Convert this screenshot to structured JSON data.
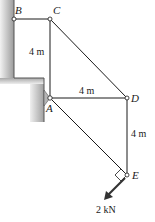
{
  "diagram": {
    "type": "truss",
    "nodes": {
      "B": {
        "label": "B",
        "x": 14,
        "y": 19
      },
      "C": {
        "label": "C",
        "x": 50,
        "y": 19
      },
      "A": {
        "label": "A",
        "x": 50,
        "y": 98
      },
      "D": {
        "label": "D",
        "x": 127,
        "y": 98
      },
      "E": {
        "label": "E",
        "x": 127,
        "y": 175
      }
    },
    "members": [
      "B-C",
      "C-A",
      "C-D",
      "A-D",
      "A-E",
      "D-E"
    ],
    "dimensions": {
      "CA": "4 m",
      "AD": "4 m",
      "DE": "4 m"
    },
    "load": {
      "label": "2 kN",
      "node": "E"
    },
    "colors": {
      "line": "#1a1a1a",
      "wall_dark": "#9a9a9a",
      "wall_light": "#e6e6e6"
    }
  }
}
